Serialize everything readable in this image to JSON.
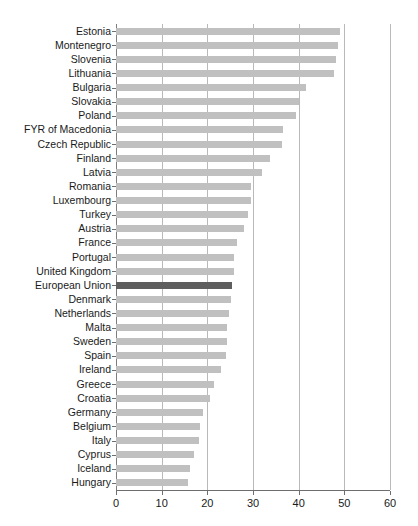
{
  "chart_data": {
    "type": "bar",
    "orientation": "horizontal",
    "title": "",
    "subtitle": "",
    "xlabel": "",
    "ylabel": "",
    "xlim": [
      0,
      60
    ],
    "xticks": [
      0,
      10,
      20,
      30,
      40,
      50,
      60
    ],
    "xtick_labels": [
      "0",
      "10",
      "20",
      "30",
      "40",
      "50",
      "60"
    ],
    "grid": "vertical",
    "legend": "none",
    "highlight_category": "European Union",
    "colors": {
      "bar": "#c0c0c0",
      "highlight_bar": "#5e5e5e",
      "gridline": "#b9b9b9",
      "axis": "#6e6e6e",
      "text": "#1a1a1a",
      "background": "#ffffff"
    },
    "categories": [
      "Estonia",
      "Montenegro",
      "Slovenia",
      "Lithuania",
      "Bulgaria",
      "Slovakia",
      "Poland",
      "FYR of Macedonia",
      "Czech Republic",
      "Finland",
      "Latvia",
      "Romania",
      "Luxembourg",
      "Turkey",
      "Austria",
      "France",
      "Portugal",
      "United Kingdom",
      "European Union",
      "Denmark",
      "Netherlands",
      "Malta",
      "Sweden",
      "Spain",
      "Ireland",
      "Greece",
      "Croatia",
      "Germany",
      "Belgium",
      "Italy",
      "Cyprus",
      "Iceland",
      "Hungary"
    ],
    "values": [
      49.0,
      48.6,
      48.2,
      47.8,
      41.5,
      40.0,
      39.5,
      36.5,
      36.4,
      33.8,
      31.9,
      29.6,
      29.5,
      29.0,
      28.0,
      26.6,
      25.9,
      25.8,
      25.5,
      25.1,
      24.8,
      24.3,
      24.2,
      24.0,
      23.1,
      21.4,
      20.5,
      19.0,
      18.5,
      18.1,
      17.0,
      16.1,
      15.7
    ]
  }
}
